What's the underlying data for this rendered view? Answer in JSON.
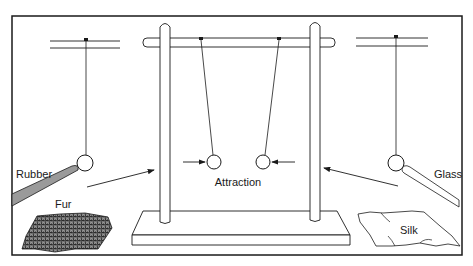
{
  "diagram": {
    "labels": {
      "rubber": "Rubber",
      "fur": "Fur",
      "attraction": "Attraction",
      "glass": "Glass",
      "silk": "Silk"
    },
    "colors": {
      "line": "#1a1a1a",
      "rubber_fill": "#9a9a9a",
      "background": "#ffffff"
    },
    "parts": [
      {
        "id": "left-pendulum",
        "description": "Pith ball hanging from support, touched by rubber rod"
      },
      {
        "id": "stand",
        "description": "Wooden stand with two hanging pith balls attracting each other"
      },
      {
        "id": "right-pendulum",
        "description": "Pith ball hanging from support, touched by glass rod"
      }
    ]
  }
}
